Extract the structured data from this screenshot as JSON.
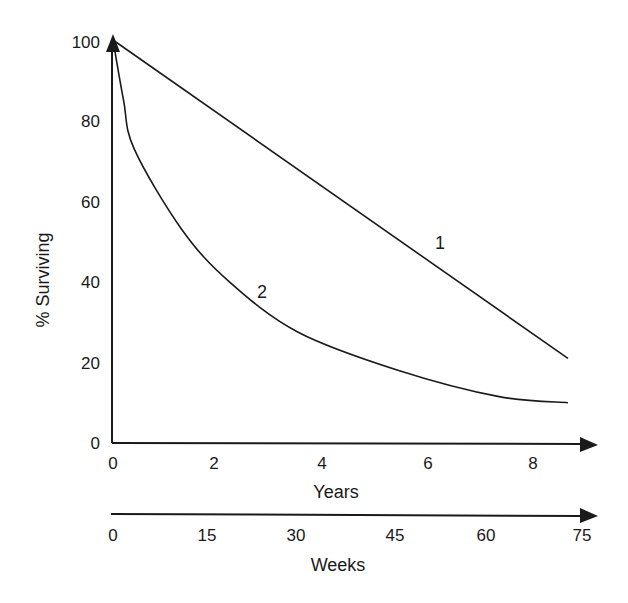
{
  "chart_data": {
    "type": "line",
    "title": "",
    "ylabel": "% Surviving",
    "xlabel": "Years",
    "secondary_xlabel": "Weeks",
    "ylim": [
      0,
      100
    ],
    "xlim": [
      0,
      9
    ],
    "y_ticks": [
      "0",
      "20",
      "40",
      "60",
      "80",
      "100"
    ],
    "x_ticks": [
      "0",
      "2",
      "4",
      "6",
      "8"
    ],
    "secondary_x_ticks": [
      "0",
      "15",
      "30",
      "45",
      "60",
      "75"
    ],
    "grid": false,
    "legend": "none (curves labeled inline)",
    "series": [
      {
        "name": "1",
        "x": [
          0,
          8.6
        ],
        "y": [
          100,
          21
        ]
      },
      {
        "name": "2",
        "x": [
          0,
          0.2,
          0.4,
          1.3,
          2.2,
          3.5,
          5.4,
          7.3,
          8.6
        ],
        "y": [
          100,
          85,
          73,
          53,
          40,
          27.5,
          18,
          11.5,
          10
        ]
      }
    ]
  },
  "labels": {
    "ylabel": "% Surviving",
    "xlabel": "Years",
    "weeks_label": "Weeks",
    "curve1": "1",
    "curve2": "2"
  }
}
